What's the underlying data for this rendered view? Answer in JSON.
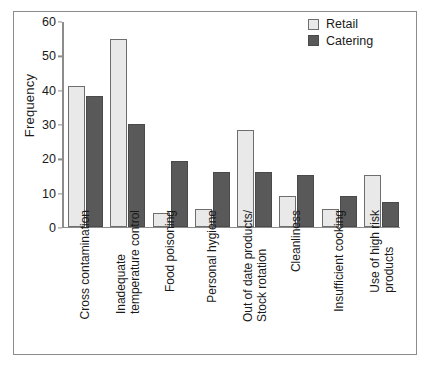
{
  "chart_data": {
    "type": "bar",
    "title": "",
    "xlabel": "",
    "ylabel": "Frequency",
    "ylim": [
      0,
      60
    ],
    "yticks": [
      0,
      10,
      20,
      30,
      40,
      50,
      60
    ],
    "grid": false,
    "legend_position": "top-right",
    "categories": [
      "Cross contamination",
      "Inadequate temperature control",
      "Food poisoning",
      "Personal hygiene",
      "Out of date products/ Stock rotation",
      "Cleanliness",
      "Insufficient cooking",
      "Use of high risk products"
    ],
    "category_lines": [
      [
        "Cross contamination"
      ],
      [
        "Inadequate",
        "temperature control"
      ],
      [
        "Food poisoning"
      ],
      [
        "Personal hygiene"
      ],
      [
        "Out of date products/",
        "Stock rotation"
      ],
      [
        "Cleanliness"
      ],
      [
        "Insufficient cooking"
      ],
      [
        "Use of high risk",
        "products"
      ]
    ],
    "series": [
      {
        "name": "Retail",
        "color": "#e9e9e9",
        "edge_color": "#6e6e6e",
        "values": [
          41,
          54.5,
          4,
          5,
          28,
          9,
          5,
          15
        ]
      },
      {
        "name": "Catering",
        "color": "#595959",
        "edge_color": "#4a4a4a",
        "values": [
          38,
          30,
          19,
          16,
          16,
          15,
          9,
          7
        ]
      }
    ]
  },
  "legend": {
    "entries": [
      {
        "label": "Retail"
      },
      {
        "label": "Catering"
      }
    ]
  },
  "axes": {
    "y_title": "Frequency",
    "y_ticks": [
      "0",
      "10",
      "20",
      "30",
      "40",
      "50",
      "60"
    ]
  }
}
